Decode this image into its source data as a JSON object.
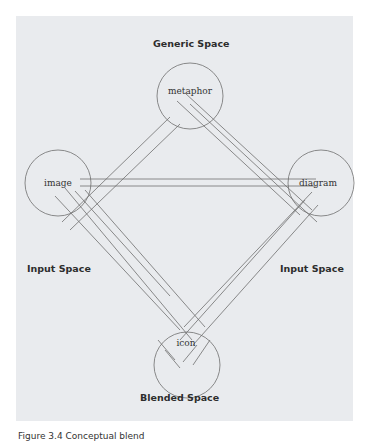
{
  "figure": {
    "labels": {
      "generic": "Generic Space",
      "input_left": "Input Space",
      "input_right": "Input Space",
      "blended": "Blended Space"
    },
    "nodes": {
      "top": "metaphor",
      "left": "image",
      "right": "diagram",
      "bottom": "icon"
    },
    "caption": "Figure 3.4  Conceptual blend"
  },
  "colors": {
    "panel": "#e9ebee",
    "line": "#6e6e6e",
    "text": "#2d2d2d"
  }
}
